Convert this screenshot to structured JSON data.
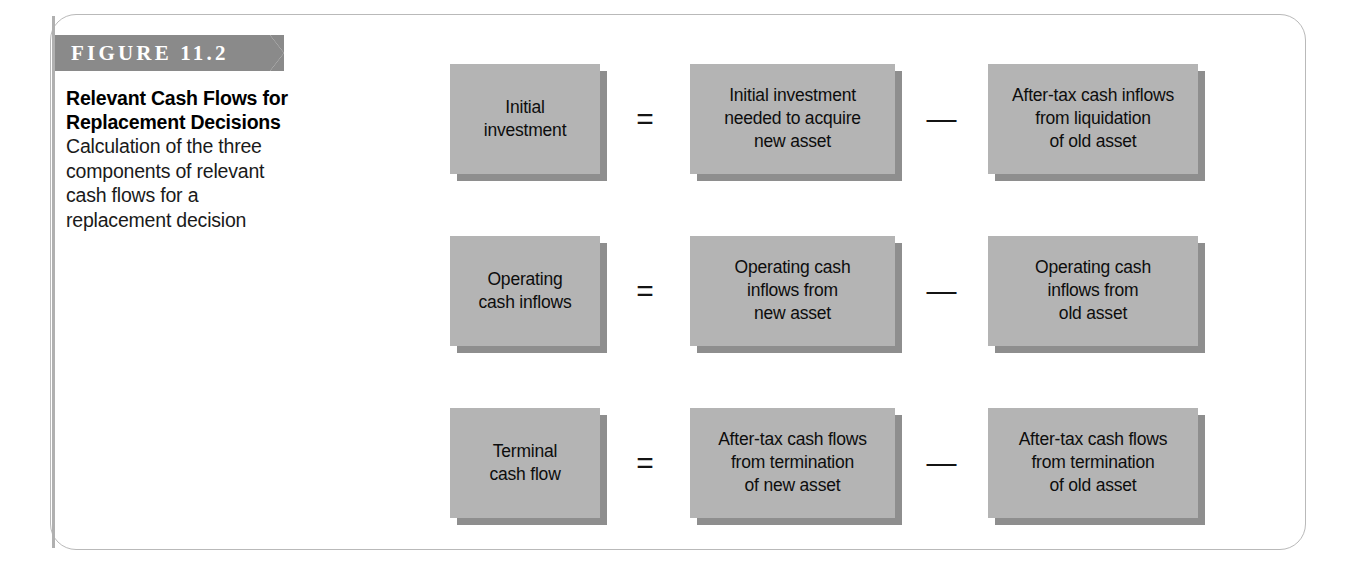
{
  "figure": {
    "banner_label": "FIGURE 11.2",
    "title_line1": "Relevant Cash Flows for",
    "title_line2": "Replacement Decisions",
    "body_line1": "Calculation of the three",
    "body_line2": "components of relevant",
    "body_line3": "cash flows for a",
    "body_line4": "replacement decision"
  },
  "colors": {
    "banner": "#8a8a8a",
    "box_fill": "#b4b4b4",
    "box_shadow": "#8e8e8e",
    "frame_border": "#b9b9b9",
    "rule": "#b0b0b0"
  },
  "diagram": {
    "equals_symbol": "=",
    "minus_symbol": "—",
    "rows": [
      {
        "id": "initial-investment",
        "left": "Initial\ninvestment",
        "left_l1": "Initial",
        "left_l2": "investment",
        "middle_l1": "Initial investment",
        "middle_l2": "needed to acquire",
        "middle_l3": "new asset",
        "right_l1": "After-tax cash inflows",
        "right_l2": "from liquidation",
        "right_l3": "of old asset"
      },
      {
        "id": "operating-cash-inflows",
        "left_l1": "Operating",
        "left_l2": "cash inflows",
        "middle_l1": "Operating cash",
        "middle_l2": "inflows from",
        "middle_l3": "new asset",
        "right_l1": "Operating cash",
        "right_l2": "inflows from",
        "right_l3": "old asset"
      },
      {
        "id": "terminal-cash-flow",
        "left_l1": "Terminal",
        "left_l2": "cash flow",
        "middle_l1": "After-tax cash flows",
        "middle_l2": "from termination",
        "middle_l3": "of new asset",
        "right_l1": "After-tax cash flows",
        "right_l2": "from termination",
        "right_l3": "of old asset"
      }
    ]
  }
}
